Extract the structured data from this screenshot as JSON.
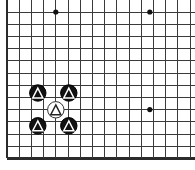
{
  "figure": {
    "kind": "go-board-diagram",
    "width": 195,
    "height": 170,
    "background_color": "#ffffff",
    "caption": ""
  },
  "board": {
    "line_color": "#3a3a3a",
    "edge_color": "#2b2b2b",
    "line_width": 1,
    "edge_line_width": 2.4,
    "grid_spacing": 12.2,
    "origin_x": 7,
    "origin_y": 12,
    "columns": 16,
    "rows": 13,
    "left_edge_is_board_border": true,
    "bottom_edge_is_board_border": true,
    "top_edge_is_cut_off": true,
    "right_edge_is_cut_off": true,
    "vertical_lines_x": [
      7,
      19.2,
      31.4,
      43.6,
      55.8,
      68,
      80.2,
      92.4,
      104.6,
      116.8,
      129,
      141.2,
      153.4,
      165.6,
      177.8,
      190
    ],
    "horizontal_lines_y": [
      12,
      24.2,
      36.4,
      48.6,
      60.8,
      73,
      85.2,
      97.4,
      109.6,
      121.8,
      134,
      146.2,
      158.4
    ]
  },
  "star_points": {
    "color": "#111111",
    "radius": 2.6,
    "points": [
      {
        "name": "hoshi-top-left",
        "x": 55.8,
        "y": 12
      },
      {
        "name": "hoshi-top-right",
        "x": 149.8,
        "y": 12
      },
      {
        "name": "hoshi-right-middle",
        "x": 149.8,
        "y": 109.6
      }
    ]
  },
  "stones": {
    "radius": 8.2,
    "black_fill": "#111111",
    "black_outline": "#000000",
    "white_fill": "#ffffff",
    "white_outline": "#333333",
    "black_mark_color": "#ffffff",
    "white_mark_color": "#222222",
    "list": [
      {
        "name": "black-stone-upper-left",
        "color": "black",
        "mark": "triangle",
        "x": 37.8,
        "y": 93
      },
      {
        "name": "black-stone-upper-right",
        "color": "black",
        "mark": "triangle",
        "x": 68.8,
        "y": 93
      },
      {
        "name": "white-stone-center",
        "color": "white",
        "mark": "triangle",
        "x": 55.8,
        "y": 109.8
      },
      {
        "name": "black-stone-lower-left",
        "color": "black",
        "mark": "triangle",
        "x": 37.8,
        "y": 125.8
      },
      {
        "name": "black-stone-lower-right",
        "color": "black",
        "mark": "triangle",
        "x": 68.8,
        "y": 125.8
      }
    ]
  }
}
